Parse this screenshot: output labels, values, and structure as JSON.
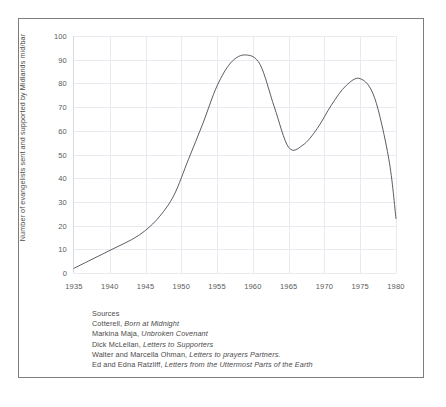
{
  "figure": {
    "background_color": "#ffffff",
    "border_color": "#7d7d7d",
    "line_color": "#4a4a52",
    "grid_color": "#e9e9ef"
  },
  "axes": {
    "ylabel": "Number of evangelists sent and supported by Midlands mid/bar",
    "xlabel": "",
    "yticks": [
      "100",
      "90",
      "80",
      "70",
      "60",
      "50",
      "40",
      "30",
      "20",
      "10",
      "0"
    ],
    "xticks": [
      "1935",
      "1940",
      "1945",
      "1950",
      "1955",
      "1960",
      "1965",
      "1970",
      "1975",
      "1980"
    ]
  },
  "sources": {
    "heading": "Sources",
    "entries": [
      {
        "author": "Cotterell,",
        "title": "Born at Midnight"
      },
      {
        "author": "Markina Maja,",
        "title": "Unbroken Covenant"
      },
      {
        "author": "Dick McLellan,",
        "title": "Letters to Supporters"
      },
      {
        "author": "Walter and Marcella Ohman,",
        "title": "Letters to prayers Partners."
      },
      {
        "author": "Ed and Edna Ratzliff,",
        "title": "Letters from the Uttermost Parts of the Earth"
      }
    ]
  },
  "chart_data": {
    "type": "line",
    "title": "",
    "xlabel": "",
    "ylabel": "Number of evangelists sent and supported by Midlands mid/bar",
    "xlim": [
      1935,
      1980
    ],
    "ylim": [
      0,
      100
    ],
    "grid": true,
    "legend": "none",
    "x": [
      1935,
      1937,
      1939,
      1941,
      1943,
      1945,
      1947,
      1949,
      1951,
      1953,
      1955,
      1957,
      1959,
      1961,
      1963,
      1965,
      1967,
      1969,
      1971,
      1973,
      1975,
      1977,
      1979,
      1980
    ],
    "values": [
      2,
      5,
      8,
      11,
      14,
      18,
      24,
      33,
      48,
      63,
      79,
      89,
      92,
      88,
      70,
      53,
      54,
      61,
      71,
      79,
      82,
      74,
      48,
      23
    ],
    "series": [
      {
        "name": "Evangelists",
        "values": [
          2,
          5,
          8,
          11,
          14,
          18,
          24,
          33,
          48,
          63,
          79,
          89,
          92,
          88,
          70,
          53,
          54,
          61,
          71,
          79,
          82,
          74,
          48,
          23
        ]
      }
    ],
    "annotations": {
      "start_value": 2,
      "first_peak": {
        "year": 1959,
        "value": 92
      },
      "trough": {
        "year": 1965,
        "value": 52
      },
      "second_peak": {
        "year": 1974,
        "value": 82
      },
      "end_value": 23
    }
  }
}
